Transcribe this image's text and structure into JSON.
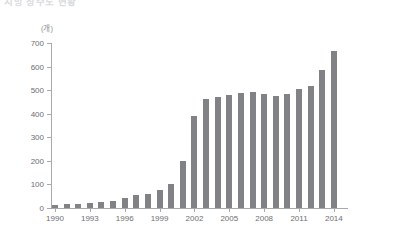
{
  "title": "지방 상수도 현황",
  "unit_label": "(개)",
  "chart_data": {
    "type": "bar",
    "title": "지방 상수도 현황",
    "xlabel": "",
    "ylabel": "",
    "unit": "개",
    "ylim": [
      0,
      700
    ],
    "ytick_step": 100,
    "grid": false,
    "legend": "none",
    "bar_color": "#808285",
    "axis_color": "#a7a9ac",
    "text_color": "#6d6e71",
    "categories": [
      "1990",
      "1991",
      "1992",
      "1993",
      "1994",
      "1995",
      "1996",
      "1997",
      "1998",
      "1999",
      "2000",
      "2001",
      "2002",
      "2003",
      "2004",
      "2005",
      "2006",
      "2007",
      "2008",
      "2009",
      "2010",
      "2011",
      "2012",
      "2013",
      "2014"
    ],
    "values": [
      13,
      16,
      19,
      22,
      25,
      28,
      42,
      55,
      61,
      75,
      101,
      201,
      389,
      462,
      470,
      480,
      487,
      491,
      484,
      474,
      483,
      505,
      518,
      585,
      667
    ],
    "tick_labels": [
      "1990",
      "1993",
      "1996",
      "1999",
      "2002",
      "2005",
      "2008",
      "2011",
      "2014"
    ],
    "ytick_labels": [
      "0",
      "100",
      "200",
      "300",
      "400",
      "500",
      "600",
      "700"
    ]
  }
}
